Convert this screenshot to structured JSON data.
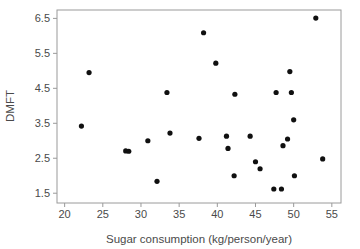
{
  "chart_data": {
    "type": "scatter",
    "title": "",
    "xlabel": "Sugar consumption (kg/person/year)",
    "ylabel": "DMFT",
    "xlim": [
      19.0,
      56.2
    ],
    "ylim": [
      1.22,
      6.74
    ],
    "xticks": [
      20,
      25,
      30,
      35,
      40,
      45,
      50,
      55
    ],
    "yticks": [
      1.5,
      2.5,
      3.5,
      4.5,
      5.5,
      6.5
    ],
    "xtick_labels": [
      "20",
      "25",
      "30",
      "35",
      "40",
      "45",
      "50",
      "55"
    ],
    "ytick_labels": [
      "1.5",
      "2.5",
      "3.5",
      "4.5",
      "5.5",
      "6.5"
    ],
    "grid": false,
    "legend": null,
    "marker": "filled-circle",
    "marker_color": "#101010",
    "marker_size_px": 5.2,
    "frame_color": "#9a9a9a",
    "n_points": 31,
    "x": [
      22.2,
      23.2,
      28.0,
      28.4,
      30.9,
      32.1,
      33.4,
      33.8,
      37.6,
      37.7,
      38.2,
      39.8,
      41.2,
      41.4,
      42.2,
      42.3,
      44.3,
      45.0,
      45.6,
      47.4,
      47.7,
      48.4,
      48.6,
      49.2,
      49.5,
      49.7,
      50.0,
      50.1,
      52.9,
      53.8,
      45.3
    ],
    "y": [
      3.42,
      4.95,
      2.71,
      2.7,
      3.0,
      1.84,
      4.38,
      3.22,
      3.07,
      3.0,
      6.09,
      5.22,
      3.13,
      2.78,
      2.0,
      4.33,
      3.13,
      2.4,
      2.2,
      1.62,
      4.38,
      1.62,
      2.86,
      3.05,
      4.98,
      4.38,
      3.6,
      2.0,
      6.51,
      2.48,
      2.4
    ],
    "points": [
      {
        "sugar": 22.2,
        "dmft": 3.42
      },
      {
        "sugar": 23.2,
        "dmft": 4.95
      },
      {
        "sugar": 28.0,
        "dmft": 2.71
      },
      {
        "sugar": 28.4,
        "dmft": 2.7
      },
      {
        "sugar": 30.9,
        "dmft": 3.0
      },
      {
        "sugar": 32.1,
        "dmft": 1.84
      },
      {
        "sugar": 33.4,
        "dmft": 4.38
      },
      {
        "sugar": 33.8,
        "dmft": 3.22
      },
      {
        "sugar": 37.6,
        "dmft": 3.07
      },
      {
        "sugar": 38.2,
        "dmft": 6.09
      },
      {
        "sugar": 39.8,
        "dmft": 5.22
      },
      {
        "sugar": 41.2,
        "dmft": 3.13
      },
      {
        "sugar": 41.4,
        "dmft": 2.78
      },
      {
        "sugar": 42.2,
        "dmft": 2.0
      },
      {
        "sugar": 42.3,
        "dmft": 4.33
      },
      {
        "sugar": 44.3,
        "dmft": 3.13
      },
      {
        "sugar": 45.0,
        "dmft": 2.4
      },
      {
        "sugar": 45.6,
        "dmft": 2.2
      },
      {
        "sugar": 47.4,
        "dmft": 1.62
      },
      {
        "sugar": 47.7,
        "dmft": 4.38
      },
      {
        "sugar": 48.4,
        "dmft": 1.62
      },
      {
        "sugar": 48.6,
        "dmft": 2.86
      },
      {
        "sugar": 49.2,
        "dmft": 3.05
      },
      {
        "sugar": 49.5,
        "dmft": 4.98
      },
      {
        "sugar": 49.7,
        "dmft": 4.38
      },
      {
        "sugar": 50.0,
        "dmft": 3.6
      },
      {
        "sugar": 50.1,
        "dmft": 2.0
      },
      {
        "sugar": 52.9,
        "dmft": 6.51
      },
      {
        "sugar": 53.8,
        "dmft": 2.48
      }
    ]
  },
  "layout": {
    "plot_left_px": 57,
    "plot_right_px": 341,
    "plot_top_px": 10,
    "plot_bottom_px": 203,
    "tick_len_px": 4
  }
}
